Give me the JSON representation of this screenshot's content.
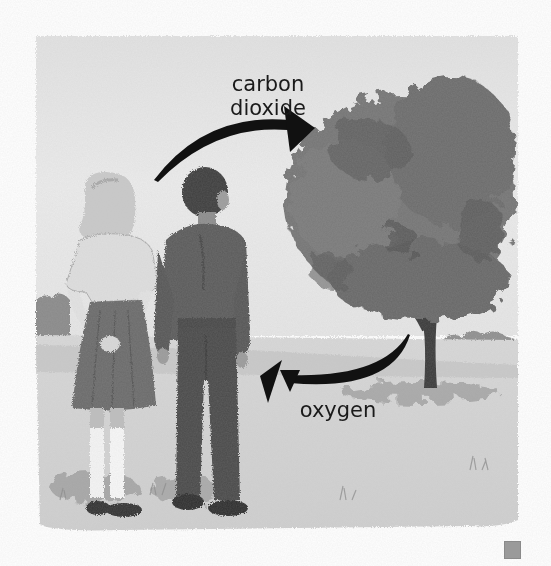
{
  "diagram": {
    "type": "photosynthesis-gas-exchange-illustration",
    "style": "vintage grayscale textbook illustration",
    "labels": {
      "to_tree": "carbon\ndioxide",
      "to_tree_line1": "carbon",
      "to_tree_line2": "dioxide",
      "to_people": "oxygen"
    },
    "arrows": [
      {
        "from": "children",
        "to": "tree",
        "label": "carbon dioxide",
        "direction": "curved, pointing right"
      },
      {
        "from": "tree",
        "to": "children",
        "label": "oxygen",
        "direction": "curved, pointing left"
      }
    ],
    "figures": [
      {
        "name": "girl",
        "description": "blonde girl, light blouse, dark pleated skirt, white knee socks, hands clasped behind back"
      },
      {
        "name": "boy",
        "description": "dark-haired boy, dark long-sleeve shirt, dark trousers, dark shoes"
      },
      {
        "name": "tree",
        "description": "large leafy deciduous tree with dark trunk"
      }
    ],
    "colors": {
      "background": "#ffffff",
      "arrow": "#111111",
      "text": "#1a1a1a",
      "tree_foliage": "#6e6e6e",
      "ground": "#d4d4d4",
      "sky": "#e8e8e8",
      "corner_square": "#9a9a9a"
    }
  }
}
